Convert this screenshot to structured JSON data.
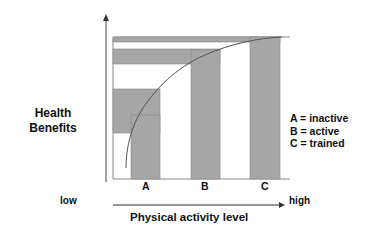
{
  "diagram": {
    "y_axis_label_line1": "Health",
    "y_axis_label_line2": "Benefits",
    "x_axis_label": "Physical activity level",
    "x_axis_low": "low",
    "x_axis_high": "high",
    "categories": [
      "A",
      "B",
      "C"
    ],
    "legend": [
      "A = inactive",
      "B = active",
      "C = trained"
    ],
    "colors": {
      "bar_fill": "#a6a6a6",
      "line": "#555555",
      "axis": "#444444",
      "background": "#ffffff"
    }
  }
}
